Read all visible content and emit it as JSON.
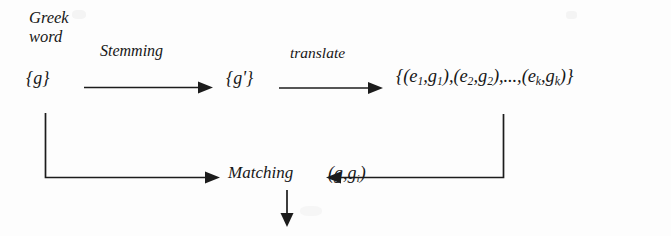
{
  "figure": {
    "type": "flow-diagram",
    "background_color": "#fdfdfd",
    "ink_color": "#1c1c1c",
    "source_label": "Greek\nword",
    "source_label_line1": "Greek",
    "source_label_line2": "word"
  },
  "nodes": {
    "greek_set": "{g}",
    "stem_set_base": "{g",
    "stem_set_prime": "'",
    "stem_set_close": "}",
    "stem_set_full": "{g'}",
    "translation_set": {
      "open": "{(",
      "e1": "e",
      "e1_sub": "1",
      "comma1": ",",
      "g1": "g",
      "g1_sub": "1",
      "close1": "),(",
      "e2": "e",
      "e2_sub": "2",
      "comma2": ",",
      "g2": "g",
      "g2_sub": "2",
      "close2": "),...,(",
      "ek": "e",
      "ek_sub": "k",
      "comma3": ",",
      "gk": "g",
      "gk_sub": "k",
      "end": ")}",
      "plain": "{(e1,g1),(e2,g2),...,(ek,gk)}"
    },
    "match_pair": {
      "open": "(",
      "g": "g",
      "comma": ",",
      "gi": "g",
      "gi_sub": "i",
      "close": ")",
      "plain": "(g,gi)"
    }
  },
  "edges": {
    "stemming_label": "Stemming",
    "translate_label": "translate",
    "matching_label": "Matching"
  }
}
